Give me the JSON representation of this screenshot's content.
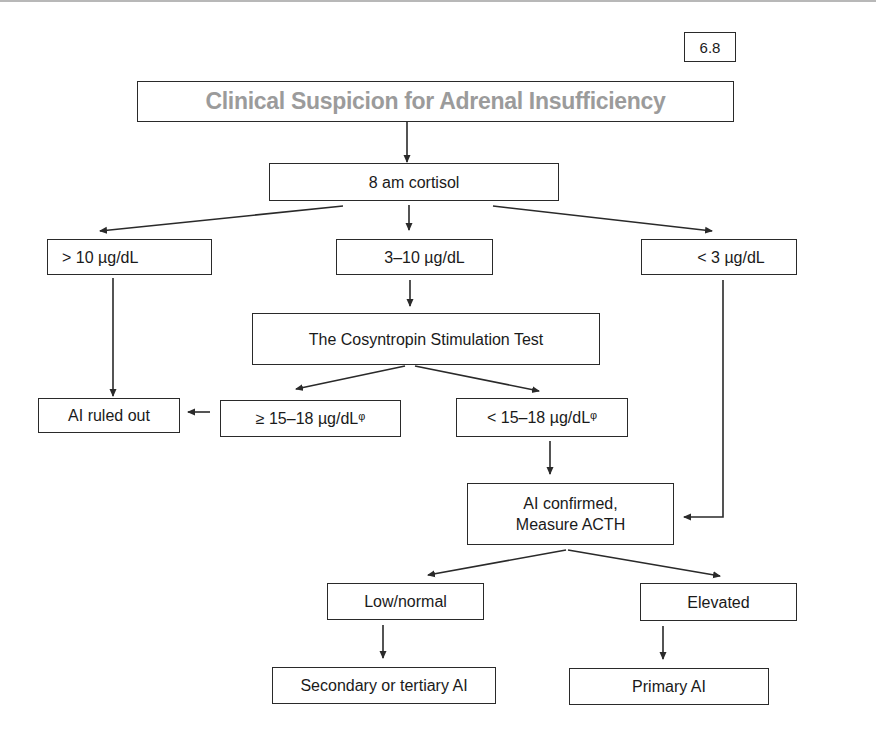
{
  "figure_number": "6.8",
  "title": "Clinical Suspicion for Adrenal Insufficiency",
  "colors": {
    "title_text": "#9b9b9b",
    "border": "#2a2a2a",
    "arrow": "#2a2a2a"
  },
  "nodes": {
    "cortisol": "8 am cortisol",
    "high": "> 10 µg/dL",
    "mid": "3–10 µg/dL",
    "low": "< 3 µg/dL",
    "stim_test": "The Cosyntropin Stimulation Test",
    "ruled_out": "AI ruled out",
    "stim_high": "≥ 15–18 µg/dLᵠ",
    "stim_low": "< 15–18 µg/dLᵠ",
    "confirmed_line1": "AI confirmed,",
    "confirmed_line2": "Measure ACTH",
    "acth_low": "Low/normal",
    "acth_high": "Elevated",
    "secondary": "Secondary or tertiary AI",
    "primary": "Primary AI"
  },
  "edges": [
    [
      "title",
      "cortisol"
    ],
    [
      "cortisol",
      "high"
    ],
    [
      "cortisol",
      "mid"
    ],
    [
      "cortisol",
      "low"
    ],
    [
      "high",
      "ruled_out"
    ],
    [
      "mid",
      "stim_test"
    ],
    [
      "stim_test",
      "stim_high"
    ],
    [
      "stim_test",
      "stim_low"
    ],
    [
      "stim_high",
      "ruled_out"
    ],
    [
      "stim_low",
      "confirmed"
    ],
    [
      "low",
      "confirmed"
    ],
    [
      "confirmed",
      "acth_low"
    ],
    [
      "confirmed",
      "acth_high"
    ],
    [
      "acth_low",
      "secondary"
    ],
    [
      "acth_high",
      "primary"
    ]
  ]
}
